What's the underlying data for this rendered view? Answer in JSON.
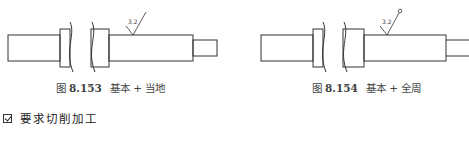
{
  "figures": [
    {
      "id": "8.153",
      "prefix": "图",
      "number": "8.153",
      "title": "基本 + 当地",
      "roughness_value": "3.2",
      "symbol_variant": "basic-local"
    },
    {
      "id": "8.154",
      "prefix": "图",
      "number": "8.154",
      "title": "基本 + 全周",
      "roughness_value": "3.2",
      "symbol_variant": "basic-all-around"
    }
  ],
  "checklist": {
    "checked": true,
    "label": "要求切削加工"
  },
  "colors": {
    "line": "#333333",
    "text": "#444444"
  }
}
